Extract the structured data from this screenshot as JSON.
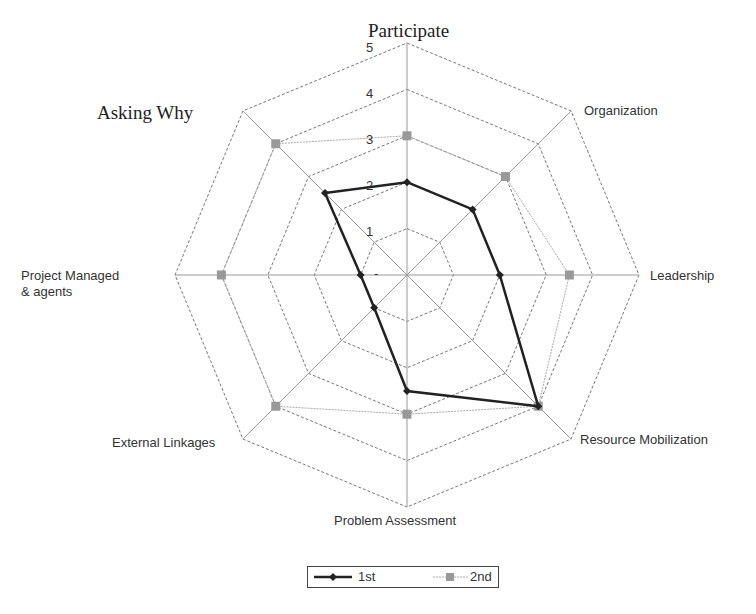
{
  "chart_data": {
    "type": "radar",
    "title": "",
    "axes": [
      "Participate",
      "Organization",
      "Leadership",
      "Resource Mobilization",
      "Problem Assessment",
      "External Linkages",
      "Project Managed & agents",
      "Asking Why"
    ],
    "scale": {
      "min": 0,
      "max": 5,
      "ticks": [
        1,
        2,
        3,
        4,
        5
      ]
    },
    "series": [
      {
        "name": "1st",
        "color": "#222222",
        "marker": "diamond",
        "values": [
          2,
          2,
          2,
          4,
          2.5,
          1,
          1,
          2.5
        ]
      },
      {
        "name": "2nd",
        "color": "#999999",
        "marker": "square",
        "values": [
          3,
          3,
          3.5,
          4,
          3,
          4,
          4,
          4
        ]
      }
    ],
    "legend_position": "bottom"
  },
  "labels": {
    "participate": "Participate",
    "organization": "Organization",
    "leadership": "Leadership",
    "resource": "Resource Mobilization",
    "problem": "Problem Assessment",
    "external": "External Linkages",
    "project_line1": "Project Managed",
    "project_line2": "& agents",
    "asking": "Asking  Why"
  },
  "ticks": {
    "t1": "1",
    "t2": "2",
    "t3": "3",
    "t4": "4",
    "t5": "5",
    "t0": "-"
  },
  "legend": {
    "s1": "1st",
    "s2": "2nd"
  }
}
